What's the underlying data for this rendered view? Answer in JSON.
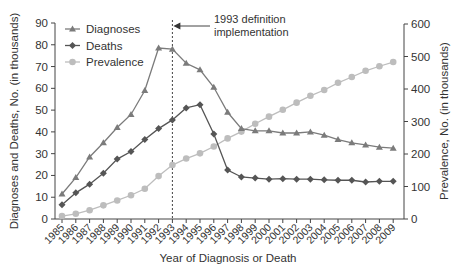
{
  "chart_data": {
    "type": "line",
    "title": "",
    "xlabel": "Year of Diagnosis or Death",
    "ylabel": "Diagnoses and Deaths, No. (in thousands)",
    "y2label": "Prevalence, No. (in thousands)",
    "ylim": [
      0,
      90
    ],
    "y2lim": [
      0,
      600
    ],
    "yticks": [
      0,
      10,
      20,
      30,
      40,
      50,
      60,
      70,
      80,
      90
    ],
    "y2ticks": [
      0,
      100,
      200,
      300,
      400,
      500,
      600
    ],
    "grid": false,
    "legend_position": "upper left",
    "x": [
      1985,
      1986,
      1987,
      1988,
      1989,
      1990,
      1991,
      1992,
      1993,
      1994,
      1995,
      1996,
      1997,
      1998,
      1999,
      2000,
      2001,
      2002,
      2003,
      2004,
      2005,
      2006,
      2007,
      2008,
      2009
    ],
    "series": [
      {
        "name": "Diagnoses",
        "axis": "left",
        "marker": "triangle",
        "color": "#7b7b7b",
        "values": [
          11.5,
          19,
          28.5,
          35,
          42,
          48,
          59,
          78.5,
          78,
          71.5,
          68.5,
          60.5,
          49,
          41.5,
          40.5,
          40.5,
          39.5,
          39.5,
          40,
          38.5,
          36.5,
          35,
          34,
          33,
          32.5
        ]
      },
      {
        "name": "Deaths",
        "axis": "left",
        "marker": "diamond",
        "color": "#555555",
        "values": [
          6.5,
          12,
          16,
          21,
          27.5,
          31,
          36.5,
          41.5,
          45.5,
          51,
          52.5,
          39,
          22.5,
          19.3,
          18.8,
          18.3,
          18.5,
          18.3,
          18.3,
          18,
          17.8,
          17.8,
          17,
          17.3,
          17.3
        ]
      },
      {
        "name": "Prevalence",
        "axis": "right",
        "marker": "circle",
        "color": "#bdbdbd",
        "values": [
          9,
          16,
          27,
          42,
          57,
          73,
          93,
          132,
          166,
          186,
          202,
          223,
          248,
          269,
          293,
          315,
          336,
          358,
          379,
          397,
          419,
          437,
          456,
          470,
          483
        ]
      }
    ],
    "annotations": [
      {
        "x": 1993,
        "line": "dashed-vertical",
        "text_lines": [
          "1993 definition",
          "implementation"
        ]
      }
    ]
  }
}
